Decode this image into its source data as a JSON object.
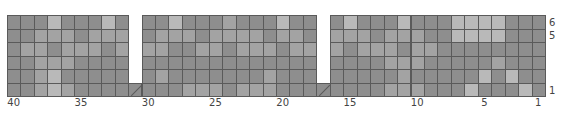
{
  "chart_data": {
    "type": "heatmap",
    "title": "",
    "columns": 40,
    "rows": 6,
    "column_numbering": "right-to-left, 40 at left to 1 at right",
    "row_numbering": "bottom-to-top, 1 at bottom to 6 at top",
    "x_tick_labels": [
      "40",
      "35",
      "30",
      "25",
      "20",
      "15",
      "10",
      "5",
      "1"
    ],
    "x_tick_columns": [
      40,
      35,
      30,
      25,
      20,
      15,
      10,
      5,
      1
    ],
    "y_tick_labels": [
      "6",
      "5",
      "1"
    ],
    "y_tick_rows": [
      6,
      5,
      1
    ],
    "legend": {
      "D": {
        "name": "dark gray",
        "color": "#8e8e8e"
      },
      "M": {
        "name": "medium gray",
        "color": "#a3a3a3"
      },
      "L": {
        "name": "light gray",
        "color": "#b9b9b9"
      },
      "X": {
        "name": "no stitch",
        "color": "#ffffff"
      },
      "S": {
        "name": "slashed stitch",
        "color": "#8e8e8e"
      }
    },
    "grid_rows_top_to_bottom": [
      {
        "row": 6,
        "cells": "DDDLDDDLDXDDLDDDMDDDLDDXDLDDDLDDDLLLLDDD"
      },
      {
        "row": 5,
        "cells": "DDMMMDMMMXDMMMDMMMMDMMDXMMMDMMMDDLLLLDDD"
      },
      {
        "row": 4,
        "cells": "DMMDMMMDMXMMDDMMDMMMDMMXMDMMMDMMDDDDDDDD"
      },
      {
        "row": 3,
        "cells": "DDMMMDDDDXDDDDDDDDDDDDDXDDDDMMMDDDDDMDDD"
      },
      {
        "row": 2,
        "cells": "DDMLDDDDDXDMDDDDDDDMDDDXDDDDDMDDDDDLDLDD"
      },
      {
        "row": 1,
        "cells": "DDMLMDDDDSDDDMMMDMMMDDDSDDDDMMMDDDLDDDLD"
      }
    ]
  }
}
